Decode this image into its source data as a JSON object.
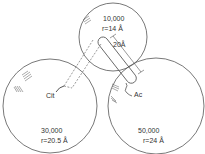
{
  "diagram": {
    "stroke_color": "#555555",
    "subunits": [
      {
        "id": "top",
        "mass": "10,000",
        "radius": "r=14 Å",
        "cx": 113,
        "cy": 37,
        "r": 34
      },
      {
        "id": "left",
        "mass": "30,000",
        "radius": "r=20.5 Å",
        "cx": 50,
        "cy": 106,
        "r": 47
      },
      {
        "id": "right",
        "mass": "50,000",
        "radius": "r=24 Å",
        "cx": 156,
        "cy": 106,
        "r": 48
      }
    ],
    "labels": {
      "cit": "Cit",
      "ac": "Ac",
      "rod_length": "20Å"
    }
  }
}
